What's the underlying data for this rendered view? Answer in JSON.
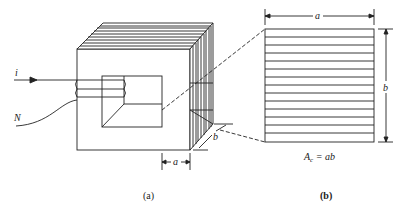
{
  "figure": {
    "panel_a": {
      "caption": "(a)",
      "current_label": "i",
      "turns_label": "N",
      "width_label": "a",
      "depth_label": "b",
      "lamination_count": 9,
      "coil_turns": 3
    },
    "panel_b": {
      "caption": "(b)",
      "width_label": "a",
      "height_label": "b",
      "area_formula": "A_c = ab",
      "area_symbol": "A",
      "area_subscript": "c",
      "area_rhs": " = ab",
      "lamination_rows": 14
    }
  }
}
